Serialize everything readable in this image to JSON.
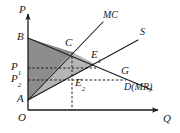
{
  "figure": {
    "kind": "economics-supply-demand-diagram",
    "width": 180,
    "height": 133,
    "background": "#ffffff",
    "ink": "#1a1a1a"
  },
  "axes": {
    "vertical_label": "P",
    "horizontal_label": "Q",
    "origin_label": "O",
    "x_axis": {
      "x1": 28,
      "y1": 110,
      "x2": 162,
      "y2": 110
    },
    "y_axis": {
      "x1": 28,
      "y1": 110,
      "x2": 28,
      "y2": 10
    }
  },
  "points": [
    {
      "name": "B",
      "label": "B",
      "sub": "",
      "x": 28,
      "y": 38,
      "lx": 17,
      "ly": 31
    },
    {
      "name": "A",
      "label": "A",
      "sub": "",
      "x": 28,
      "y": 100,
      "lx": 17,
      "ly": 93
    },
    {
      "name": "C",
      "label": "C",
      "sub": "",
      "x": 72,
      "y": 52,
      "lx": 66,
      "ly": 38
    },
    {
      "name": "E1",
      "label": "E",
      "sub": "1",
      "x": 95,
      "y": 64,
      "lx": 92,
      "ly": 50
    },
    {
      "name": "E2",
      "label": "E",
      "sub": "2",
      "x": 72,
      "y": 80,
      "lx": 75,
      "ly": 78
    },
    {
      "name": "G",
      "label": "G",
      "sub": "",
      "x": 125,
      "y": 75,
      "lx": 122,
      "ly": 66
    }
  ],
  "price_ticks": [
    {
      "label": "P",
      "sub": "1",
      "y": 68,
      "lx": 12,
      "ly": 61
    },
    {
      "label": "P",
      "sub": "2",
      "y": 80,
      "lx": 12,
      "ly": 73
    }
  ],
  "curves": [
    {
      "id": "mc",
      "label": "MC",
      "label_x": 104,
      "label_y": 13,
      "desc": "marginal cost curve, upward sloping from A through C",
      "x1": 28,
      "y1": 100,
      "x2": 103,
      "y2": 22
    },
    {
      "id": "s",
      "label": "S",
      "label_x": 141,
      "label_y": 30,
      "desc": "supply curve, upward sloping from A through E1",
      "x1": 28,
      "y1": 100,
      "x2": 138,
      "y2": 40
    },
    {
      "id": "dmr",
      "label": "D(MR)",
      "label_x": 126,
      "label_y": 84,
      "desc": "demand / marginal revenue curve, downward sloping from B through C, E1, G",
      "x1": 28,
      "y1": 38,
      "x2": 152,
      "y2": 90
    }
  ],
  "shaded_regions": [
    {
      "id": "upper-dark",
      "desc": "dark triangle B-C-A bounded by P axis, demand curve and MC curve",
      "fill": "#8c8c8c",
      "points": "28,38 72,52 28,100"
    },
    {
      "id": "lower-light",
      "desc": "lighter triangle A-C-E1 area below the MC curve down to A",
      "fill": "#b3b3b3",
      "points": "28,100 72,52 95,64"
    }
  ],
  "dashed_guides": [
    {
      "id": "p1-guide",
      "desc": "horizontal dashed line at P1 to E1",
      "x1": 28,
      "y1": 68,
      "x2": 96,
      "y2": 68
    },
    {
      "id": "p2-guide",
      "desc": "horizontal dashed line at P2 to G",
      "x1": 28,
      "y1": 80,
      "x2": 126,
      "y2": 80
    },
    {
      "id": "q-guide",
      "desc": "vertical dashed line from C down through E2 to Q axis",
      "x1": 72,
      "y1": 52,
      "x2": 72,
      "y2": 110
    }
  ]
}
